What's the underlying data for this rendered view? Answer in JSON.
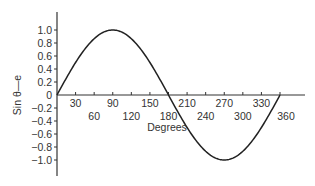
{
  "chart_data": {
    "type": "line",
    "title": "",
    "xlabel": "Degrees",
    "ylabel": "Sin θ—e",
    "xlim": [
      0,
      360
    ],
    "ylim": [
      -1.0,
      1.0
    ],
    "grid": false,
    "legend": null,
    "x_ticks_upper": [
      "30",
      "90",
      "150",
      "210",
      "270",
      "330"
    ],
    "x_ticks_lower": [
      "60",
      "120",
      "180",
      "240",
      "300",
      "360"
    ],
    "y_ticks": [
      "1.0",
      "0.8",
      "0.6",
      "0.4",
      "0.2",
      "0",
      "-0.2",
      "-0.4",
      "-0.6",
      "-0.8",
      "-1.0"
    ],
    "series": [
      {
        "name": "sin θ",
        "x": [
          0,
          30,
          60,
          90,
          120,
          150,
          180,
          210,
          240,
          270,
          300,
          330,
          360
        ],
        "values": [
          0,
          0.5,
          0.866,
          1.0,
          0.866,
          0.5,
          0,
          -0.5,
          -0.866,
          -1.0,
          -0.866,
          -0.5,
          0
        ]
      }
    ]
  }
}
